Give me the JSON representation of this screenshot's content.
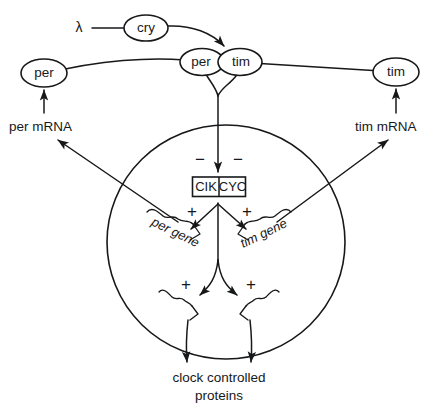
{
  "diagram": {
    "background_color": "#ffffff",
    "ink_color": "#17181a",
    "nodes": {
      "light": "λ",
      "cry": "cry",
      "per_left": "per",
      "per_dimer": "per",
      "tim_dimer": "tim",
      "tim_right": "tim"
    },
    "complex_box": {
      "left_subunit": "CIK",
      "right_subunit": "CYC"
    },
    "labels": {
      "per_mrna": "per mRNA",
      "tim_mrna": "tim mRNA",
      "per_gene": "per gene",
      "tim_gene": "tim gene",
      "output_line1": "clock controlled",
      "output_line2": "proteins"
    },
    "signs": {
      "repress_left": "−",
      "repress_right": "−",
      "activate_upper_left": "+",
      "activate_upper_right": "+",
      "activate_lower_left": "+",
      "activate_lower_right": "+"
    }
  }
}
